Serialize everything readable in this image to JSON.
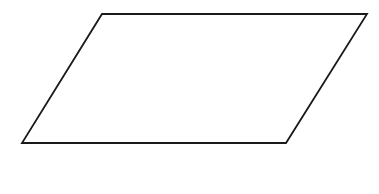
{
  "canvas": {
    "width": 379,
    "height": 194,
    "background_color": "#ffffff",
    "description": "line-drawing of a single parallelogram"
  },
  "figure": {
    "name": "parallelogram",
    "shape_type": "parallelogram",
    "fill": "none",
    "fill_color": "#ffffff",
    "stroke_color": "#1a1a1a",
    "stroke_width": 1.8,
    "vertices": [
      {
        "label": "top-left",
        "x": 102,
        "y": 14
      },
      {
        "label": "top-right",
        "x": 367,
        "y": 14
      },
      {
        "label": "bottom-right",
        "x": 286,
        "y": 143
      },
      {
        "label": "bottom-left",
        "x": 22,
        "y": 143
      }
    ],
    "points_attr": "102,14 367,14 286,143 22,143",
    "edges": [
      {
        "name": "top-edge",
        "from": "top-left",
        "to": "top-right",
        "orientation": "horizontal"
      },
      {
        "name": "right-edge",
        "from": "top-right",
        "to": "bottom-right",
        "orientation": "slanted"
      },
      {
        "name": "bottom-edge",
        "from": "bottom-right",
        "to": "bottom-left",
        "orientation": "horizontal"
      },
      {
        "name": "left-edge",
        "from": "bottom-left",
        "to": "top-left",
        "orientation": "slanted"
      }
    ]
  }
}
